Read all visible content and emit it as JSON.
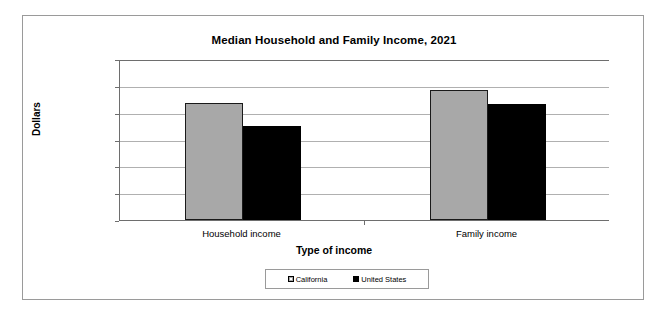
{
  "chart_data": {
    "type": "bar",
    "title": "Median Household and Family Income, 2021",
    "xlabel": "Type of income",
    "ylabel": "Dollars",
    "categories": [
      "Household income",
      "Family income"
    ],
    "series": [
      {
        "name": "California",
        "values": [
          87500,
          96600
        ],
        "color": "#a8a8a8"
      },
      {
        "name": "United States",
        "values": [
          70200,
          86800
        ],
        "color": "#000000"
      }
    ],
    "ylim": [
      0,
      120000
    ],
    "ytick_values": [
      0,
      20000,
      40000,
      60000,
      80000,
      100000,
      120000
    ],
    "ytick_labels": [
      "0",
      "20,000",
      "40,000",
      "60,000",
      "80,000",
      "100,000",
      "120,000"
    ],
    "grid": true,
    "legend_position": "bottom"
  }
}
